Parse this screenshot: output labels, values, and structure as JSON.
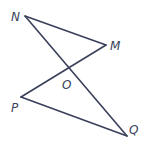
{
  "diagram": {
    "type": "geometry",
    "points": [
      {
        "id": "N",
        "label": "N"
      },
      {
        "id": "M",
        "label": "M"
      },
      {
        "id": "O",
        "label": "O"
      },
      {
        "id": "P",
        "label": "P"
      },
      {
        "id": "Q",
        "label": "Q"
      }
    ],
    "segments": [
      {
        "from": "N",
        "to": "M"
      },
      {
        "from": "N",
        "to": "Q"
      },
      {
        "from": "M",
        "to": "P"
      },
      {
        "from": "P",
        "to": "Q"
      }
    ],
    "colors": {
      "line": "#3a3f5a",
      "label": "#3a3f5a",
      "background": "#ffffff"
    }
  }
}
